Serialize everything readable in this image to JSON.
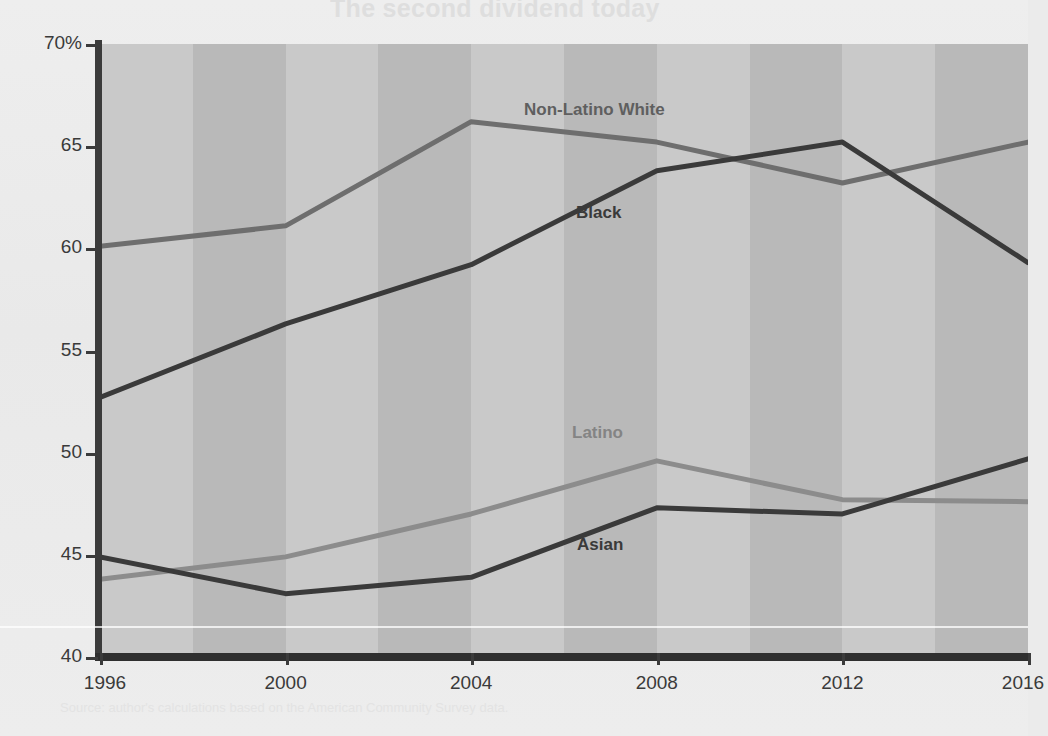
{
  "page": {
    "background_color": "#ebebeb",
    "ghost_text_top": "The second dividend today",
    "ghost_text_middle": "Opportunity and Inclusion",
    "ghost_text_lower": "Percent of U.S. adults, by race and ethnicity",
    "ghost_text_bottom": "Source: author's calculations based on the American Community Survey data."
  },
  "chart_data": {
    "type": "line",
    "title": "",
    "subtitle": "",
    "xlabel": "",
    "ylabel": "",
    "xlim": [
      1996,
      2016
    ],
    "ylim": [
      40,
      70
    ],
    "grid": false,
    "legend_position": "inline-labels",
    "x": [
      1996,
      1998,
      2000,
      2002,
      2004,
      2006,
      2008,
      2010,
      2012,
      2014,
      2016
    ],
    "x_tick_labels": [
      "1996",
      "2000",
      "2004",
      "2008",
      "2012",
      "2016"
    ],
    "x_ticks": [
      1996,
      2000,
      2004,
      2008,
      2012,
      2016
    ],
    "y_tick_labels": [
      "70%",
      "65",
      "60",
      "55",
      "50",
      "45",
      "40"
    ],
    "y_ticks": [
      70,
      65,
      60,
      55,
      50,
      45,
      40
    ],
    "background_bands": "alternating light/dark gray every 2 years",
    "series": [
      {
        "name": "Non-Latino White",
        "color": "#6e6e6e",
        "label_color": "#5f5f5f",
        "x": [
          1996,
          2000,
          2004,
          2008,
          2012,
          2016
        ],
        "values": [
          60.1,
          61.1,
          66.2,
          65.2,
          63.2,
          65.2
        ]
      },
      {
        "name": "Black",
        "color": "#3a3a3a",
        "label_color": "#3a3a3a",
        "x": [
          1996,
          2000,
          2004,
          2008,
          2012,
          2016
        ],
        "values": [
          52.7,
          56.3,
          59.2,
          63.8,
          65.2,
          59.3
        ]
      },
      {
        "name": "Latino",
        "color": "#8c8c8c",
        "label_color": "#848484",
        "x": [
          1996,
          2000,
          2004,
          2008,
          2012,
          2016
        ],
        "values": [
          43.8,
          44.9,
          47.0,
          49.6,
          47.7,
          47.6
        ]
      },
      {
        "name": "Asian",
        "color": "#3a3a3a",
        "label_color": "#3a3a3a",
        "x": [
          1996,
          2000,
          2004,
          2008,
          2012,
          2016
        ],
        "values": [
          44.9,
          43.1,
          43.9,
          47.3,
          47.0,
          49.7
        ]
      }
    ],
    "series_labels": [
      {
        "text": "Non-Latino White",
        "x_px": 524,
        "y_px": 100,
        "color": "#5f5f5f"
      },
      {
        "text": "Black",
        "x_px": 576,
        "y_px": 203,
        "color": "#3a3a3a"
      },
      {
        "text": "Latino",
        "x_px": 572,
        "y_px": 423,
        "color": "#848484"
      },
      {
        "text": "Asian",
        "x_px": 577,
        "y_px": 535,
        "color": "#3a3a3a"
      }
    ]
  }
}
